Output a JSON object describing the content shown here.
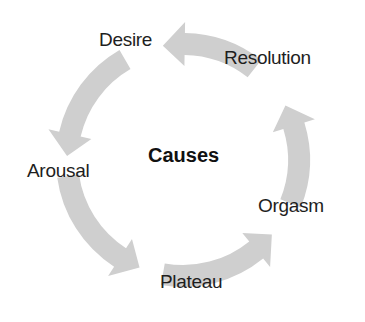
{
  "diagram": {
    "type": "cycle",
    "center_label": "Causes",
    "stages": [
      {
        "label": "Desire"
      },
      {
        "label": "Arousal"
      },
      {
        "label": "Plateau"
      },
      {
        "label": "Orgasm"
      },
      {
        "label": "Resolution"
      }
    ],
    "flow": [
      {
        "from": "Desire",
        "to": "Arousal"
      },
      {
        "from": "Arousal",
        "to": "Plateau"
      },
      {
        "from": "Plateau",
        "to": "Orgasm"
      },
      {
        "from": "Orgasm",
        "to": "Resolution"
      },
      {
        "from": "Resolution",
        "to": "Desire"
      }
    ],
    "arrow_color": "#cfcfcf",
    "text_color": "#1e1e1e"
  }
}
